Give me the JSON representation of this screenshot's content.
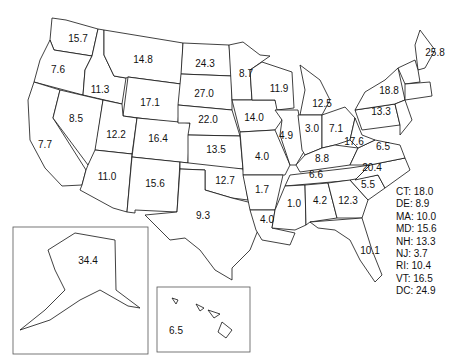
{
  "map": {
    "type": "choropleth-values",
    "region": "United States",
    "states": {
      "WA": "15.7",
      "OR": "7.6",
      "CA": "7.7",
      "ID": "11.3",
      "NV": "8.5",
      "MT": "14.8",
      "WY": "17.1",
      "UT": "12.2",
      "AZ": "11.0",
      "CO": "16.4",
      "NM": "15.6",
      "ND": "24.3",
      "SD": "27.0",
      "NE": "22.0",
      "KS": "13.5",
      "OK": "12.7",
      "TX": "9.3",
      "MN": "8.7",
      "IA": "14.0",
      "MO": "4.0",
      "AR": "1.7",
      "LA": "4.0",
      "WI": "11.9",
      "IL": "4.9",
      "MI": "12.5",
      "IN": "3.0",
      "OH": "7.1",
      "KY": "8.8",
      "TN": "6.6",
      "MS": "1.0",
      "AL": "4.2",
      "GA": "12.3",
      "FL": "10.1",
      "SC": "5.5",
      "NC": "20.4",
      "VA": "6.5",
      "WV": "17.6",
      "PA": "13.3",
      "NY": "18.8",
      "ME": "25.8",
      "AK": "34.4",
      "HI": "6.5"
    },
    "legend": [
      {
        "label": "CT: 18.0"
      },
      {
        "label": "DE: 8.9"
      },
      {
        "label": "MA: 10.0"
      },
      {
        "label": "MD: 15.6"
      },
      {
        "label": "NH: 13.3"
      },
      {
        "label": "NJ: 3.7"
      },
      {
        "label": "RI: 10.4"
      },
      {
        "label": "VT: 16.5"
      },
      {
        "label": "DC: 24.9"
      }
    ]
  }
}
